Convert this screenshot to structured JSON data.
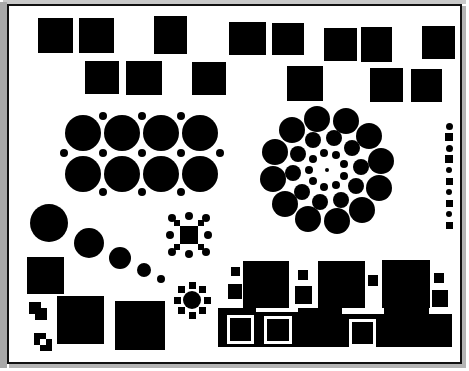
{
  "figure": {
    "background_color": "#ffffff",
    "ink_color": "#000000",
    "frame": {
      "border_color": "#111111",
      "border_width": 2,
      "shadow_color_light": "#c9c9c9",
      "shadow_color_dark": "#b4b4b4",
      "x": 7,
      "y": 4,
      "width": 455,
      "height": 360
    },
    "canvas": {
      "width": 469,
      "height": 371
    }
  },
  "groups": {
    "squares_row1": {
      "label": "top-row-squares",
      "items": [
        {
          "x": 36,
          "y": 16,
          "w": 35,
          "h": 35
        },
        {
          "x": 77,
          "y": 16,
          "w": 35,
          "h": 35
        },
        {
          "x": 152,
          "y": 14,
          "w": 33,
          "h": 38
        },
        {
          "x": 227,
          "y": 20,
          "w": 37,
          "h": 33
        },
        {
          "x": 270,
          "y": 21,
          "w": 32,
          "h": 32
        },
        {
          "x": 322,
          "y": 26,
          "w": 33,
          "h": 33
        },
        {
          "x": 359,
          "y": 25,
          "w": 31,
          "h": 35
        },
        {
          "x": 420,
          "y": 24,
          "w": 33,
          "h": 33
        }
      ]
    },
    "squares_row2": {
      "label": "second-row-squares",
      "items": [
        {
          "x": 83,
          "y": 59,
          "w": 34,
          "h": 33
        },
        {
          "x": 124,
          "y": 59,
          "w": 36,
          "h": 34
        },
        {
          "x": 190,
          "y": 60,
          "w": 34,
          "h": 33
        },
        {
          "x": 285,
          "y": 64,
          "w": 36,
          "h": 35
        },
        {
          "x": 368,
          "y": 66,
          "w": 33,
          "h": 34
        },
        {
          "x": 409,
          "y": 67,
          "w": 31,
          "h": 33
        }
      ]
    },
    "circle_grid": {
      "label": "left-packed-circle-grid",
      "big_radius": 18,
      "small_radius": 4,
      "rows": 2,
      "cols": 4,
      "big_circles": [
        {
          "cx": 81,
          "cy": 131,
          "r": 18
        },
        {
          "cx": 120,
          "cy": 131,
          "r": 18
        },
        {
          "cx": 159,
          "cy": 131,
          "r": 18
        },
        {
          "cx": 198,
          "cy": 131,
          "r": 18
        },
        {
          "cx": 81,
          "cy": 172,
          "r": 18
        },
        {
          "cx": 120,
          "cy": 172,
          "r": 18
        },
        {
          "cx": 159,
          "cy": 172,
          "r": 18
        },
        {
          "cx": 198,
          "cy": 172,
          "r": 18
        }
      ],
      "small_dots": [
        {
          "cx": 101,
          "cy": 114,
          "r": 4
        },
        {
          "cx": 140,
          "cy": 114,
          "r": 4
        },
        {
          "cx": 179,
          "cy": 114,
          "r": 4
        },
        {
          "cx": 62,
          "cy": 151,
          "r": 4
        },
        {
          "cx": 101,
          "cy": 151,
          "r": 4
        },
        {
          "cx": 140,
          "cy": 151,
          "r": 4
        },
        {
          "cx": 179,
          "cy": 151,
          "r": 4
        },
        {
          "cx": 218,
          "cy": 151,
          "r": 4
        },
        {
          "cx": 101,
          "cy": 190,
          "r": 4
        },
        {
          "cx": 140,
          "cy": 190,
          "r": 4
        },
        {
          "cx": 179,
          "cy": 190,
          "r": 4
        }
      ]
    },
    "spiral_rings": {
      "label": "right-concentric-ring-cluster",
      "center": {
        "cx": 325,
        "cy": 168
      },
      "rings": [
        {
          "name": "ring-outer",
          "count": 12,
          "radius": 55,
          "dot_r": 13,
          "start_angle": -100
        },
        {
          "name": "ring-middle",
          "count": 10,
          "radius": 34,
          "dot_r": 8,
          "start_angle": -78
        },
        {
          "name": "ring-inner",
          "count": 9,
          "radius": 18,
          "dot_r": 4,
          "start_angle": -60
        },
        {
          "name": "ring-core",
          "count": 1,
          "radius": 0,
          "dot_r": 2,
          "start_angle": 0
        }
      ]
    },
    "dot_column": {
      "label": "right-edge-alternating-column",
      "x": 447,
      "start_y": 124,
      "step": 11,
      "items": [
        {
          "shape": "circle",
          "size": 7
        },
        {
          "shape": "square",
          "size": 8
        },
        {
          "shape": "circle",
          "size": 7
        },
        {
          "shape": "square",
          "size": 8
        },
        {
          "shape": "circle",
          "size": 6
        },
        {
          "shape": "square",
          "size": 7
        },
        {
          "shape": "circle",
          "size": 6
        },
        {
          "shape": "square",
          "size": 7
        },
        {
          "shape": "circle",
          "size": 6
        },
        {
          "shape": "square",
          "size": 7
        }
      ]
    },
    "diagonal_chain": {
      "label": "decreasing-circle-chain",
      "items": [
        {
          "cx": 47,
          "cy": 221,
          "r": 19
        },
        {
          "cx": 87,
          "cy": 241,
          "r": 15
        },
        {
          "cx": 118,
          "cy": 256,
          "r": 11
        },
        {
          "cx": 142,
          "cy": 268,
          "r": 7
        },
        {
          "cx": 159,
          "cy": 277,
          "r": 4
        }
      ]
    },
    "x_pattern": {
      "label": "x-shaped-square-and-dot-motif",
      "center": {
        "cx": 187,
        "cy": 233
      },
      "cell": 6,
      "squares_offsets": [
        {
          "dx": -12,
          "dy": -12
        },
        {
          "dx": -6,
          "dy": -6
        },
        {
          "dx": 0,
          "dy": 0
        },
        {
          "dx": 6,
          "dy": 6
        },
        {
          "dx": 12,
          "dy": 12
        },
        {
          "dx": 12,
          "dy": -12
        },
        {
          "dx": 6,
          "dy": -6
        },
        {
          "dx": -6,
          "dy": 6
        },
        {
          "dx": -12,
          "dy": 12
        },
        {
          "dx": -6,
          "dy": 0
        },
        {
          "dx": 6,
          "dy": 0
        },
        {
          "dx": 0,
          "dy": -6
        },
        {
          "dx": 0,
          "dy": 6
        }
      ],
      "dots": [
        {
          "cx": 170,
          "cy": 216,
          "r": 4
        },
        {
          "cx": 204,
          "cy": 216,
          "r": 4
        },
        {
          "cx": 170,
          "cy": 250,
          "r": 4
        },
        {
          "cx": 204,
          "cy": 250,
          "r": 4
        },
        {
          "cx": 187,
          "cy": 214,
          "r": 4
        },
        {
          "cx": 187,
          "cy": 252,
          "r": 4
        },
        {
          "cx": 168,
          "cy": 233,
          "r": 4
        },
        {
          "cx": 206,
          "cy": 233,
          "r": 4
        }
      ]
    },
    "flower_motif": {
      "label": "circle-with-radiating-squares",
      "center": {
        "cx": 190,
        "cy": 298
      },
      "core_r": 9,
      "petal_size": 7,
      "petal_radius": 15,
      "petal_count": 8
    },
    "plus_motifs": {
      "label": "cross-shaped-square-motifs",
      "cell": 6,
      "items": [
        {
          "cx": 36,
          "cy": 309,
          "hollow": false
        },
        {
          "cx": 41,
          "cy": 340,
          "hollow": true
        }
      ]
    },
    "bottom_left_squares": {
      "label": "bottom-left-large-squares",
      "items": [
        {
          "x": 25,
          "y": 255,
          "w": 37,
          "h": 37
        },
        {
          "x": 55,
          "y": 294,
          "w": 47,
          "h": 48
        },
        {
          "x": 113,
          "y": 299,
          "w": 50,
          "h": 49
        }
      ]
    },
    "bottom_cluster": {
      "label": "bottom-right-square-skyline",
      "items": [
        {
          "x": 229,
          "y": 265,
          "w": 9,
          "h": 9
        },
        {
          "x": 226,
          "y": 282,
          "w": 14,
          "h": 15
        },
        {
          "x": 241,
          "y": 259,
          "w": 46,
          "h": 47
        },
        {
          "x": 296,
          "y": 268,
          "w": 10,
          "h": 10
        },
        {
          "x": 293,
          "y": 284,
          "w": 17,
          "h": 18
        },
        {
          "x": 316,
          "y": 259,
          "w": 47,
          "h": 47
        },
        {
          "x": 366,
          "y": 273,
          "w": 10,
          "h": 11
        },
        {
          "x": 380,
          "y": 258,
          "w": 48,
          "h": 48
        },
        {
          "x": 432,
          "y": 271,
          "w": 10,
          "h": 10
        },
        {
          "x": 430,
          "y": 288,
          "w": 16,
          "h": 17
        },
        {
          "x": 216,
          "y": 306,
          "w": 38,
          "h": 39
        },
        {
          "x": 254,
          "y": 310,
          "w": 42,
          "h": 35
        },
        {
          "x": 265,
          "y": 317,
          "w": 22,
          "h": 22
        },
        {
          "x": 296,
          "y": 306,
          "w": 44,
          "h": 39
        },
        {
          "x": 340,
          "y": 312,
          "w": 42,
          "h": 33
        },
        {
          "x": 350,
          "y": 320,
          "w": 21,
          "h": 22
        },
        {
          "x": 382,
          "y": 306,
          "w": 45,
          "h": 39
        },
        {
          "x": 427,
          "y": 312,
          "w": 23,
          "h": 33
        }
      ],
      "white_holes": [
        {
          "x": 265,
          "y": 317,
          "w": 22,
          "h": 22
        },
        {
          "x": 350,
          "y": 320,
          "w": 21,
          "h": 22
        },
        {
          "x": 228,
          "y": 316,
          "w": 21,
          "h": 23
        }
      ]
    }
  }
}
